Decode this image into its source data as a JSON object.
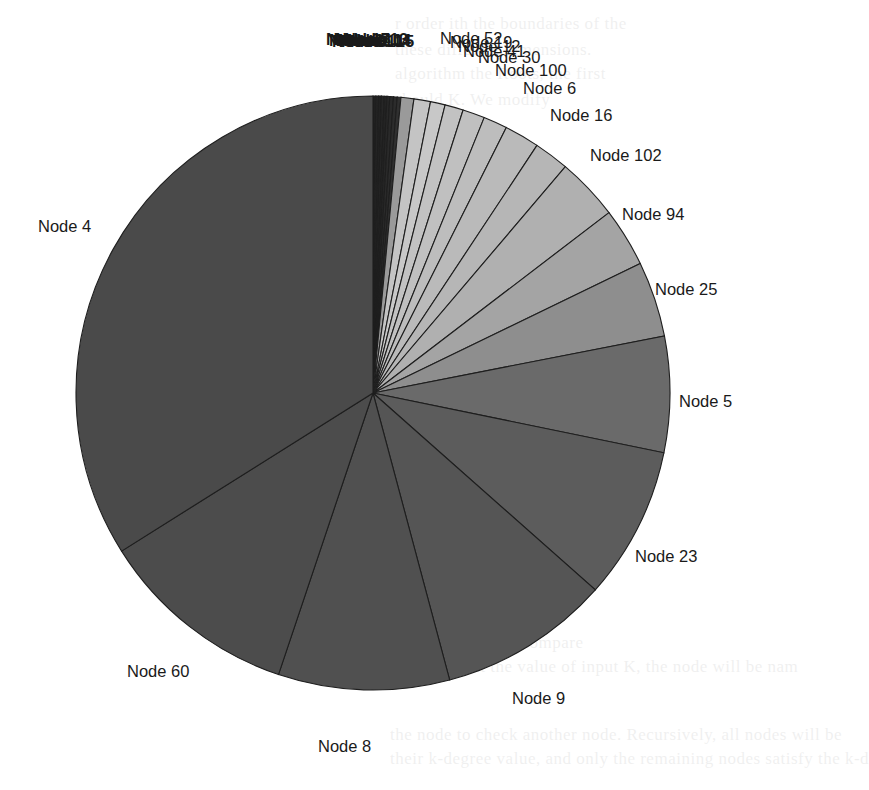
{
  "chart_data": {
    "type": "pie",
    "title": "",
    "start_angle_deg": 0,
    "direction": "clockwise",
    "center": [
      373,
      393
    ],
    "radius": 297,
    "legend": "none",
    "labels_position": "outside",
    "slices": [
      {
        "label": "Node 1",
        "value": 0.15,
        "color": "#202020",
        "show_label": false
      },
      {
        "label": "Node 2",
        "value": 0.15,
        "color": "#242424",
        "show_label": false
      },
      {
        "label": "Node 3",
        "value": 0.15,
        "color": "#222222",
        "show_label": false
      },
      {
        "label": "Node 7",
        "value": 0.15,
        "color": "#262626",
        "show_label": false
      },
      {
        "label": "Node 10",
        "value": 0.15,
        "color": "#232323",
        "show_label": false
      },
      {
        "label": "Node 11",
        "value": 0.15,
        "color": "#282828",
        "show_label": false
      },
      {
        "label": "Node 13",
        "value": 0.2,
        "color": "#2a2a2a",
        "show_label": false
      },
      {
        "label": "Node 14",
        "value": 0.2,
        "color": "#2c2c2c",
        "show_label": false
      },
      {
        "label": "Node 15",
        "value": 0.2,
        "color": "#303030",
        "show_label": false
      },
      {
        "label": "Node 52",
        "value": 0.7,
        "color": "#9a9a9a",
        "show_label": true,
        "lx": 440,
        "ly": 44
      },
      {
        "label": "Node 19",
        "value": 0.9,
        "color": "#c4c4c4",
        "show_label": true,
        "lx": 450,
        "ly": 48
      },
      {
        "label": "Node 12",
        "value": 0.8,
        "color": "#c8c8c8",
        "show_label": true,
        "lx": 458,
        "ly": 52
      },
      {
        "label": "Node 41",
        "value": 1.0,
        "color": "#c2c2c2",
        "show_label": true,
        "lx": 463,
        "ly": 57
      },
      {
        "label": "Node 30",
        "value": 1.2,
        "color": "#c0c0c0",
        "show_label": true,
        "lx": 478,
        "ly": 63
      },
      {
        "label": "Node 100",
        "value": 1.3,
        "color": "#bdbdbd",
        "show_label": true,
        "lx": 495,
        "ly": 76
      },
      {
        "label": "Node 6",
        "value": 1.9,
        "color": "#bababa",
        "show_label": true,
        "lx": 523,
        "ly": 94
      },
      {
        "label": "Node 16",
        "value": 1.9,
        "color": "#b6b6b6",
        "show_label": true,
        "lx": 550,
        "ly": 121
      },
      {
        "label": "Node 102",
        "value": 3.4,
        "color": "#b0b0b0",
        "show_label": true,
        "lx": 590,
        "ly": 161
      },
      {
        "label": "Node 94",
        "value": 3.2,
        "color": "#a4a4a4",
        "show_label": true,
        "lx": 622,
        "ly": 220
      },
      {
        "label": "Node 25",
        "value": 4.1,
        "color": "#8e8e8e",
        "show_label": true,
        "lx": 655,
        "ly": 295
      },
      {
        "label": "Node 5",
        "value": 6.3,
        "color": "#6a6a6a",
        "show_label": true,
        "lx": 679,
        "ly": 407
      },
      {
        "label": "Node 23",
        "value": 8.3,
        "color": "#5c5c5c",
        "show_label": true,
        "lx": 635,
        "ly": 562
      },
      {
        "label": "Node 9",
        "value": 9.3,
        "color": "#555555",
        "show_label": true,
        "lx": 512,
        "ly": 704
      },
      {
        "label": "Node 8",
        "value": 9.3,
        "color": "#505050",
        "show_label": true,
        "lx": 318,
        "ly": 752
      },
      {
        "label": "Node 60",
        "value": 10.9,
        "color": "#4c4c4c",
        "show_label": true,
        "lx": 127,
        "ly": 677
      },
      {
        "label": "Node 4",
        "value": 33.9,
        "color": "#4a4a4a",
        "show_label": true,
        "lx": 38,
        "ly": 232
      }
    ]
  },
  "background_bleed_text": [
    {
      "x": 395,
      "y": 14,
      "text": "r order         ith          the boundaries of the                "
    },
    {
      "x": 395,
      "y": 40,
      "text": "                      these different dimensions.               "
    },
    {
      "x": 395,
      "y": 64,
      "text": "    algorithm         the Roots, the     first                   "
    },
    {
      "x": 395,
      "y": 90,
      "text": "                  should             K. We modify                 "
    },
    {
      "x": 395,
      "y": 114,
      "text": "    search                      the            ion                  "
    },
    {
      "x": 395,
      "y": 138,
      "text": "                                          second                   "
    },
    {
      "x": 395,
      "y": 180,
      "text": "                                        either the                 "
    },
    {
      "x": 395,
      "y": 205,
      "text": "                                    algorithm                      "
    },
    {
      "x": 395,
      "y": 230,
      "text": "                                    nea                            "
    },
    {
      "x": 395,
      "y": 255,
      "text": "                                 Pre                               "
    },
    {
      "x": 430,
      "y": 530,
      "text": "                                  parts K  Ko                      "
    },
    {
      "x": 430,
      "y": 555,
      "text": "                                 for the                           "
    },
    {
      "x": 430,
      "y": 610,
      "text": "                              worst,  Let b  k                     "
    },
    {
      "x": 430,
      "y": 633,
      "text": "                     than  k-  com  compare                        "
    },
    {
      "x": 430,
      "y": 657,
      "text": "  ren   that  the  value  of  input  K, the  node  will be  nam      "
    },
    {
      "x": 390,
      "y": 725,
      "text": "  the  node  to  check  another  node.  Recursively, all nodes will be "
    },
    {
      "x": 390,
      "y": 749,
      "text": "  their  k-degree  value,  and  only  the  remaining  nodes  satisfy  the  k-d"
    }
  ]
}
